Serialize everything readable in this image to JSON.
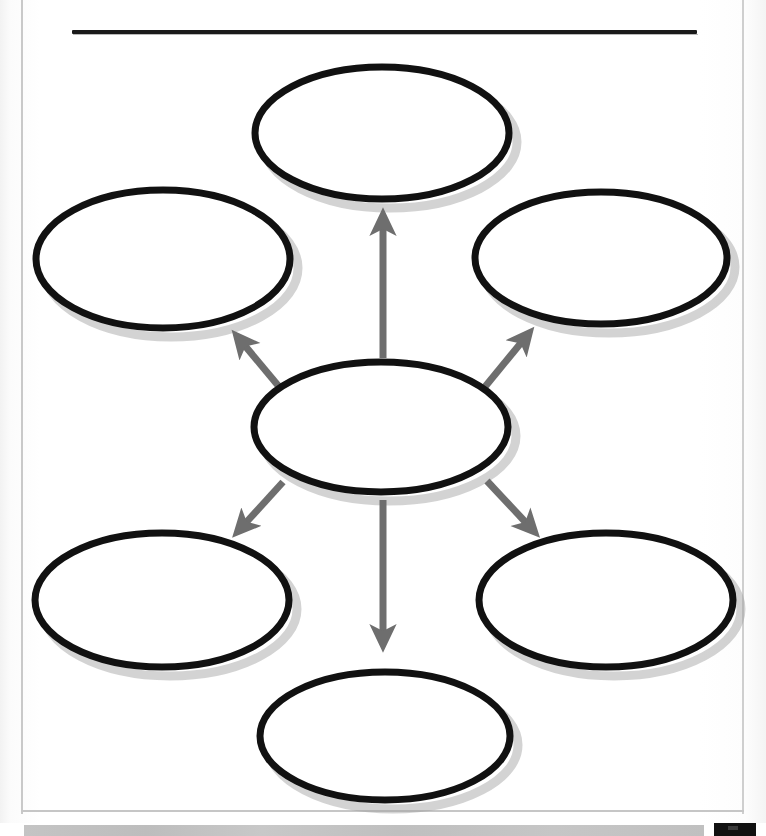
{
  "document": {
    "type": "graphic-organizer-worksheet",
    "layout": "concept-map-spider",
    "title_line_value": "",
    "title_line_placeholder": "",
    "page_background": "#ffffff",
    "border_color": "#c9c9c9"
  },
  "style": {
    "oval_stroke_color": "#111111",
    "oval_fill_color": "#ffffff",
    "oval_stroke_width": "7",
    "shadow_color": "#a8a8a8",
    "arrow_color": "#6e6e6e",
    "title_rule_color": "#1a1a1a",
    "scan_bar_color": "#c2c2c2",
    "scan_block_color": "#111111"
  },
  "nodes": [
    {
      "id": "center",
      "name": "center-topic-oval",
      "label": "",
      "placeholder": "",
      "cx": 381,
      "cy": 427,
      "rx": 127,
      "ry": 65
    },
    {
      "id": "top",
      "name": "top-detail-oval",
      "label": "",
      "placeholder": "",
      "cx": 382,
      "cy": 133,
      "rx": 127,
      "ry": 66
    },
    {
      "id": "upper-left",
      "name": "upper-left-detail-oval",
      "label": "",
      "placeholder": "",
      "cx": 163,
      "cy": 259,
      "rx": 127,
      "ry": 69
    },
    {
      "id": "upper-right",
      "name": "upper-right-detail-oval",
      "label": "",
      "placeholder": "",
      "cx": 601,
      "cy": 258,
      "rx": 126,
      "ry": 66
    },
    {
      "id": "lower-left",
      "name": "lower-left-detail-oval",
      "label": "",
      "placeholder": "",
      "cx": 162,
      "cy": 600,
      "rx": 127,
      "ry": 67
    },
    {
      "id": "lower-right",
      "name": "lower-right-detail-oval",
      "label": "",
      "placeholder": "",
      "cx": 606,
      "cy": 600,
      "rx": 127,
      "ry": 67
    },
    {
      "id": "bottom",
      "name": "bottom-detail-oval",
      "label": "",
      "placeholder": "",
      "cx": 385,
      "cy": 736,
      "rx": 125,
      "ry": 64
    }
  ],
  "connectors": [
    {
      "id": "center-to-top",
      "name": "arrow-center-to-top",
      "direction": "up",
      "from": "center",
      "to": "top"
    },
    {
      "id": "center-to-upper-left",
      "name": "arrow-center-to-upper-left",
      "direction": "up-left",
      "from": "center",
      "to": "upper-left"
    },
    {
      "id": "center-to-upper-right",
      "name": "arrow-center-to-upper-right",
      "direction": "up-right",
      "from": "center",
      "to": "upper-right"
    },
    {
      "id": "center-to-lower-left",
      "name": "arrow-center-to-lower-left",
      "direction": "down-left",
      "from": "center",
      "to": "lower-left"
    },
    {
      "id": "center-to-lower-right",
      "name": "arrow-center-to-lower-right",
      "direction": "down-right",
      "from": "center",
      "to": "lower-right"
    },
    {
      "id": "center-to-bottom",
      "name": "arrow-center-to-bottom",
      "direction": "down",
      "from": "center",
      "to": "bottom"
    }
  ]
}
